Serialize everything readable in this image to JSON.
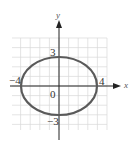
{
  "chart_data": {
    "type": "line",
    "title": "",
    "xlabel": "x",
    "ylabel": "y",
    "grid": true,
    "xlim": [
      -5,
      5
    ],
    "ylim": [
      -4.5,
      5
    ],
    "curve": {
      "kind": "ellipse",
      "center": [
        0,
        0
      ],
      "semi_major_x": 4,
      "semi_minor_y": 3,
      "equation": "x^2/16 + y^2/9 = 1"
    },
    "annotations": [
      {
        "text": "3",
        "at": [
          0,
          3
        ]
      },
      {
        "text": "-4",
        "at": [
          -4,
          0
        ]
      },
      {
        "text": "4",
        "at": [
          4,
          0
        ]
      },
      {
        "text": "0",
        "at": [
          0,
          0
        ]
      },
      {
        "text": "-3",
        "at": [
          0,
          -3
        ]
      }
    ],
    "colors": {
      "curve": "#5a5a5a",
      "grid": "#d8d8d8",
      "axis": "#222222"
    }
  },
  "labels": {
    "x_axis": "x",
    "y_axis": "y",
    "top": "3",
    "left": "−4",
    "right": "4",
    "origin": "0",
    "bottom": "−3"
  }
}
